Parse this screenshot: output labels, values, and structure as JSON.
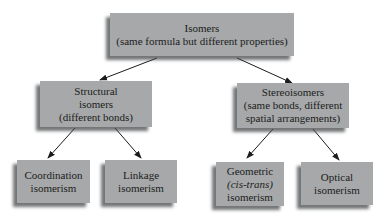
{
  "diagram": {
    "root": {
      "lines": [
        "Isomers",
        "(same formula but different properties)"
      ]
    },
    "structural": {
      "lines": [
        "Structural",
        "isomers",
        "(different bonds)"
      ]
    },
    "stereo": {
      "lines": [
        "Stereoisomers",
        "(same bonds, different",
        "spatial arrangements)"
      ]
    },
    "coordination": {
      "lines": [
        "Coordination",
        "isomerism"
      ]
    },
    "linkage": {
      "lines": [
        "Linkage",
        "isomerism"
      ]
    },
    "geometric": {
      "lines": [
        "Geometric",
        "(cis-trans)",
        "isomerism"
      ]
    },
    "optical": {
      "lines": [
        "Optical",
        "isomerism"
      ]
    }
  },
  "colors": {
    "box_fill": "#a6a8a9",
    "arrow": "#1c1c1c",
    "text": "#1c1c1c"
  }
}
